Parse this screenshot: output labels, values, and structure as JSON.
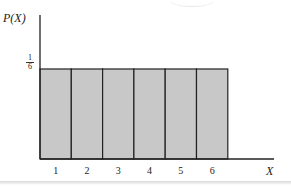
{
  "chart_data": {
    "type": "bar",
    "title": "",
    "xlabel": "X",
    "ylabel": "P(X)",
    "categories": [
      "1",
      "2",
      "3",
      "4",
      "5",
      "6"
    ],
    "values": [
      0.1667,
      0.1667,
      0.1667,
      0.1667,
      0.1667,
      0.1667
    ],
    "y_tick_labels": [
      {
        "value": 0.1667,
        "label_num": "1",
        "label_den": "6"
      }
    ],
    "ylim": [
      0,
      0.2667
    ],
    "grid": false,
    "legend": null,
    "bar_color": "#c8c8c8",
    "edge_color": "#222222"
  },
  "labels": {
    "y_axis": "P(X)",
    "x_axis": "X",
    "frac_num": "1",
    "frac_den": "6",
    "ticks": [
      "1",
      "2",
      "3",
      "4",
      "5",
      "6"
    ]
  }
}
